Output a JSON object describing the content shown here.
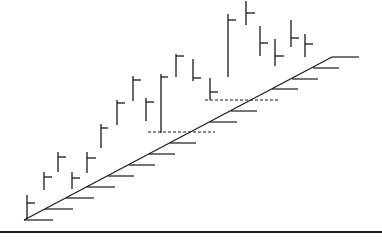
{
  "diagram": {
    "colors": {
      "stroke": "#1a1a1a",
      "background": "#ffffff"
    },
    "baseline": {
      "x1": 0,
      "x2": 382,
      "y": 232,
      "width": 2
    },
    "diagonal": {
      "x1": 24,
      "y1": 220,
      "x2": 332,
      "y2": 57
    },
    "top_extension": {
      "x1": 332,
      "x2": 359,
      "y": 57
    },
    "diagonal_ticks": [
      {
        "y": 220,
        "x1": 24,
        "x2": 53
      },
      {
        "y": 209,
        "x1": 45,
        "x2": 73
      },
      {
        "y": 198,
        "x1": 66,
        "x2": 94
      },
      {
        "y": 187,
        "x1": 87,
        "x2": 115
      },
      {
        "y": 176,
        "x1": 108,
        "x2": 134
      },
      {
        "y": 165,
        "x1": 129,
        "x2": 155
      },
      {
        "y": 154,
        "x1": 149,
        "x2": 175
      },
      {
        "y": 143,
        "x1": 170,
        "x2": 196
      },
      {
        "y": 122,
        "x1": 210,
        "x2": 237
      },
      {
        "y": 111,
        "x1": 231,
        "x2": 257
      },
      {
        "y": 89,
        "x1": 272,
        "x2": 298
      },
      {
        "y": 79,
        "x1": 292,
        "x2": 318
      },
      {
        "y": 68,
        "x1": 313,
        "x2": 339
      }
    ],
    "dashed_lines": [
      {
        "y": 132,
        "x1": 148,
        "x2": 215
      },
      {
        "y": 100,
        "x1": 205,
        "x2": 278
      }
    ],
    "bars": [
      {
        "x": 27,
        "y1": 195,
        "y2": 219,
        "tick_y": 203,
        "tick_x2": 35
      },
      {
        "x": 44,
        "y1": 172,
        "y2": 190,
        "tick_y": 177,
        "tick_x2": 52
      },
      {
        "x": 58,
        "y1": 152,
        "y2": 172,
        "tick_y": 157,
        "tick_x2": 66
      },
      {
        "x": 72,
        "y1": 172,
        "y2": 189,
        "tick_y": 178,
        "tick_x2": 80
      },
      {
        "x": 87,
        "y1": 152,
        "y2": 173,
        "tick_y": 158,
        "tick_x2": 96
      },
      {
        "x": 101,
        "y1": 124,
        "y2": 148,
        "tick_y": 128,
        "tick_x2": 108
      },
      {
        "x": 117,
        "y1": 100,
        "y2": 125,
        "tick_y": 103,
        "tick_x2": 125
      },
      {
        "x": 133,
        "y1": 76,
        "y2": 101,
        "tick_y": 80,
        "tick_x2": 141
      },
      {
        "x": 146,
        "y1": 98,
        "y2": 121,
        "tick_y": 102,
        "tick_x2": 154
      },
      {
        "x": 161,
        "y1": 74,
        "y2": 133,
        "tick_y": 77,
        "tick_x2": 168
      },
      {
        "x": 176,
        "y1": 54,
        "y2": 77,
        "tick_y": 56,
        "tick_x2": 184
      },
      {
        "x": 193,
        "y1": 59,
        "y2": 81,
        "tick_y": 78,
        "tick_x2": 201
      },
      {
        "x": 210,
        "y1": 78,
        "y2": 100,
        "tick_y": 92,
        "tick_x2": 218
      },
      {
        "x": 228,
        "y1": 14,
        "y2": 77,
        "tick_y": 20,
        "tick_x2": 236
      },
      {
        "x": 246,
        "y1": 1,
        "y2": 25,
        "tick_y": 13,
        "tick_x2": 255
      },
      {
        "x": 260,
        "y1": 26,
        "y2": 56,
        "tick_y": 43,
        "tick_x2": 268
      },
      {
        "x": 275,
        "y1": 39,
        "y2": 66,
        "tick_y": 56,
        "tick_x2": 284
      },
      {
        "x": 291,
        "y1": 20,
        "y2": 47,
        "tick_y": 38,
        "tick_x2": 299
      },
      {
        "x": 305,
        "y1": 34,
        "y2": 57,
        "tick_y": 44,
        "tick_x2": 313
      }
    ]
  }
}
